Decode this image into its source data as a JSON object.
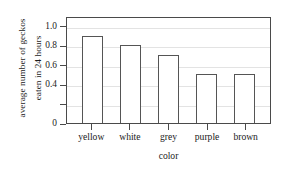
{
  "chart_data": {
    "type": "bar",
    "title": "",
    "categories": [
      "yellow",
      "white",
      "grey",
      "purple",
      "brown"
    ],
    "values": [
      0.9,
      0.8,
      0.7,
      0.5,
      0.5
    ],
    "xlabel": "color",
    "ylabel": "average number of geckos eaten in 24 hours",
    "ylabel_lines": [
      "average number of geckos",
      "eaten in 24 hours"
    ],
    "ylim": [
      0,
      1.1
    ],
    "ytick_values": [
      0,
      0.2,
      0.4,
      0.6,
      0.8,
      1.0
    ],
    "ytick_labels": [
      "0",
      "",
      "0.4",
      "0.6",
      "0.8",
      "1.0"
    ],
    "grid": true,
    "legend": "none",
    "bar_fill": "#ffffff",
    "bar_edge": "#555555",
    "grid_color": "#e3e3e3",
    "frame_color": "#4a4a4a"
  }
}
